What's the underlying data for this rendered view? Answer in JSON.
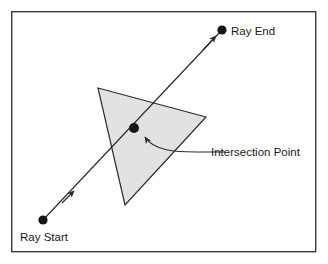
{
  "figure": {
    "background_color": "#ffffff",
    "frame": {
      "stroke_color": "#3a3a3a",
      "stroke_width": 1.4,
      "x": 11,
      "y": 11,
      "width": 305,
      "height": 241
    }
  },
  "labels": {
    "ray_start": "Ray Start",
    "ray_end": "Ray End",
    "intersection_point": "Intersection Point"
  },
  "geometry": {
    "triangle": {
      "fill_color": "#e2e2e2",
      "stroke_color": "#2b2b2b",
      "points": "98,88 206,117 125,205",
      "vertices": [
        {
          "x": 98,
          "y": 88
        },
        {
          "x": 206,
          "y": 117
        },
        {
          "x": 125,
          "y": 205
        }
      ]
    },
    "ray": {
      "stroke_color": "#2b2b2b",
      "stroke_width": 1.2,
      "start": {
        "x": 43,
        "y": 220
      },
      "end": {
        "x": 222,
        "y": 30
      },
      "arrowheads": [
        {
          "x": 72,
          "y": 193
        },
        {
          "x": 214,
          "y": 39
        }
      ]
    },
    "points": [
      {
        "name": "ray-start-point",
        "x": 43,
        "y": 220,
        "radius": 4.6,
        "color": "#151515"
      },
      {
        "name": "intersection-point",
        "x": 134,
        "y": 128,
        "radius": 5.0,
        "color": "#151515"
      },
      {
        "name": "ray-end-point",
        "x": 222,
        "y": 30,
        "radius": 4.6,
        "color": "#151515"
      }
    ],
    "callout": {
      "stroke_color": "#2b2b2b",
      "stroke_width": 1.2,
      "path": "M 225,152 L 196,152 C 176,152 154,150 145,137",
      "arrow_tip": {
        "x": 143,
        "y": 134
      }
    }
  },
  "label_positions": {
    "ray_start": {
      "x": 20,
      "y": 240
    },
    "ray_end": {
      "x": 231,
      "y": 35
    },
    "intersection_point": {
      "x": 211,
      "y": 156
    }
  }
}
